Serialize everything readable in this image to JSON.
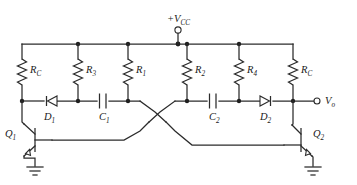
{
  "figure": {
    "type": "circuit-schematic",
    "background_color": "#ffffff",
    "line_color": "#2b2b2b",
    "label_color": "#1a1a1a"
  },
  "supply": {
    "label_main": "+V",
    "label_sub": "CC",
    "terminal_type": "open-circle",
    "x": 178,
    "y": 44
  },
  "output": {
    "label_main": "V",
    "label_sub": "o",
    "terminal_type": "open-circle",
    "x": 327,
    "y": 101
  },
  "resistors": [
    {
      "id": "RC-left",
      "label_main": "R",
      "label_sub": "C",
      "x": 22,
      "label_x": 30,
      "label_y": 73
    },
    {
      "id": "R3",
      "label_main": "R",
      "label_sub": "3",
      "x": 78,
      "label_x": 86,
      "label_y": 73
    },
    {
      "id": "R1",
      "label_main": "R",
      "label_sub": "1",
      "x": 128,
      "label_x": 136,
      "label_y": 73
    },
    {
      "id": "R2",
      "label_main": "R",
      "label_sub": "2",
      "x": 187,
      "label_x": 195,
      "label_y": 73
    },
    {
      "id": "R4",
      "label_main": "R",
      "label_sub": "4",
      "x": 239,
      "label_x": 247,
      "label_y": 73
    },
    {
      "id": "RC-right",
      "label_main": "R",
      "label_sub": "C",
      "x": 293,
      "label_x": 301,
      "label_y": 73
    }
  ],
  "capacitors": [
    {
      "id": "C1",
      "label_main": "C",
      "label_sub": "1",
      "x": 103,
      "label_x": 99,
      "label_y": 120
    },
    {
      "id": "C2",
      "label_main": "C",
      "label_sub": "2",
      "x": 213,
      "label_x": 209,
      "label_y": 120
    }
  ],
  "diodes": [
    {
      "id": "D1",
      "label_main": "D",
      "label_sub": "1",
      "x": 50,
      "direction": "left",
      "label_x": 44,
      "label_y": 120
    },
    {
      "id": "D2",
      "label_main": "D",
      "label_sub": "2",
      "x": 266,
      "direction": "right",
      "label_x": 260,
      "label_y": 120
    }
  ],
  "transistors": [
    {
      "id": "Q1",
      "label_main": "Q",
      "label_sub": "1",
      "type": "npn",
      "orientation": "left",
      "label_x": 9,
      "label_y": 137
    },
    {
      "id": "Q2",
      "label_main": "Q",
      "label_sub": "2",
      "type": "npn",
      "orientation": "right",
      "label_x": 313,
      "label_y": 137
    }
  ],
  "grounds": [
    {
      "id": "gnd-left",
      "x": 35,
      "y": 168
    },
    {
      "id": "gnd-right",
      "x": 313,
      "y": 168
    }
  ],
  "rails": {
    "top_rail_y": 44,
    "mid_rail_y": 101,
    "base_rail_left_y": 140,
    "base_rail_right_y": 146
  }
}
